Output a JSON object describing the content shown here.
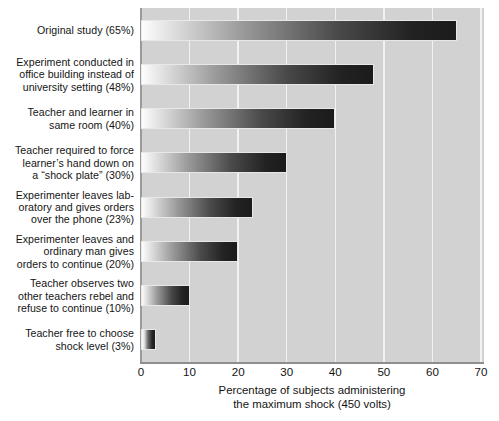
{
  "chart_data": {
    "type": "bar",
    "orientation": "horizontal",
    "title": "",
    "subtitle": "",
    "xlabel_lines": [
      "Percentage of subjects administering",
      "the maximum shock (450 volts)"
    ],
    "ylabel": "",
    "xlim": [
      0,
      70
    ],
    "xticks": [
      0,
      10,
      20,
      30,
      40,
      50,
      60,
      70
    ],
    "xtick_labels": [
      "0",
      "10",
      "20",
      "30",
      "40",
      "50",
      "60",
      "70"
    ],
    "grid": "vertical-only",
    "legend": "none",
    "categories": [
      "Original study (65%)",
      "Experiment conducted in\noffice building instead of\nuniversity setting (48%)",
      "Teacher and learner in\nsame room (40%)",
      "Teacher required to force\nlearner’s hand down on\na “shock plate” (30%)",
      "Experimenter leaves lab-\noratory and gives orders\nover the phone (23%)",
      "Experimenter leaves and\nordinary man gives\norders to continue (20%)",
      "Teacher observes two\nother teachers rebel and\nrefuse to continue (10%)",
      "Teacher free to choose\nshock level (3%)"
    ],
    "values": [
      65,
      48,
      40,
      30,
      23,
      20,
      10,
      3
    ],
    "value_labels": [
      "65%",
      "48%",
      "40%",
      "30%",
      "23%",
      "20%",
      "10%",
      "3%"
    ],
    "bar_style": {
      "fill": "horizontal-gradient",
      "gradient_from": "#fdfdfd",
      "gradient_to": "#1b1b1b",
      "outline": "#e8e8e8"
    },
    "plot_background": "#d2d2d2",
    "gridline_color": "#f2f2f2",
    "axis_color": "#8e8e8e",
    "text_color": "#141414"
  }
}
